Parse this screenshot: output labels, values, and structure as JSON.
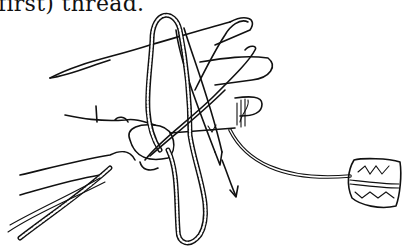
{
  "caption": {
    "text": "first) thread."
  },
  "illustration": {
    "subject": "hand-holding-netting-needle-with-thread-loop",
    "elements": [
      "hand",
      "netting-needle",
      "thread-loop",
      "thread-spool",
      "arrow"
    ]
  }
}
